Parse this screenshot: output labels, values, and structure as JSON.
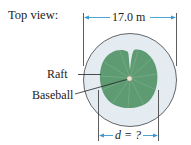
{
  "title": "Top view:",
  "dimension_top": "17.0 m",
  "dimension_bottom": "d = ?",
  "labels": {
    "raft": "Raft",
    "baseball": "Baseball"
  },
  "colors": {
    "pool_fill": "#e4ecf2",
    "pool_stroke": "#555555",
    "raft_fill": "#5e9a72",
    "raft_vein": "#8cc09c",
    "dimension_line": "#3a9ad0",
    "baseball": "#f0e6d6"
  }
}
